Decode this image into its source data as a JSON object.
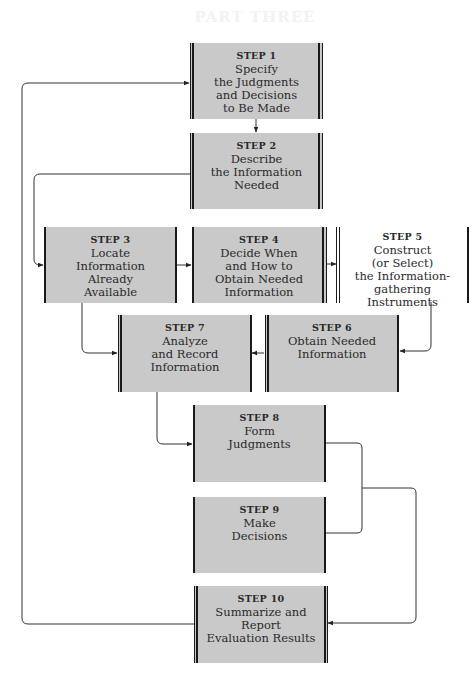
{
  "diagram": {
    "header_bleed": "PART THREE",
    "steps": [
      {
        "id": 1,
        "label": "STEP 1",
        "lines": [
          "Specify",
          "the Judgments",
          "and Decisions",
          "to Be Made"
        ]
      },
      {
        "id": 2,
        "label": "STEP 2",
        "lines": [
          "Describe",
          "the Information",
          "Needed"
        ]
      },
      {
        "id": 3,
        "label": "STEP 3",
        "lines": [
          "Locate",
          "Information",
          "Already",
          "Available"
        ]
      },
      {
        "id": 4,
        "label": "STEP 4",
        "lines": [
          "Decide When",
          "and How to",
          "Obtain Needed",
          "Information"
        ]
      },
      {
        "id": 5,
        "label": "STEP 5",
        "lines": [
          "Construct",
          "(or Select)",
          "the Information-",
          "gathering",
          "Instruments"
        ]
      },
      {
        "id": 6,
        "label": "STEP 6",
        "lines": [
          "Obtain Needed",
          "Information"
        ]
      },
      {
        "id": 7,
        "label": "STEP 7",
        "lines": [
          "Analyze",
          "and Record",
          "Information"
        ]
      },
      {
        "id": 8,
        "label": "STEP 8",
        "lines": [
          "Form",
          "Judgments"
        ]
      },
      {
        "id": 9,
        "label": "STEP 9",
        "lines": [
          "Make",
          "Decisions"
        ]
      },
      {
        "id": 10,
        "label": "STEP 10",
        "lines": [
          "Summarize and",
          "Report",
          "Evaluation Results"
        ]
      }
    ],
    "edges": [
      {
        "from": 1,
        "to": 2
      },
      {
        "from": 2,
        "to": 3
      },
      {
        "from": 3,
        "to": 4
      },
      {
        "from": 4,
        "to": 5
      },
      {
        "from": 5,
        "to": 6
      },
      {
        "from": 6,
        "to": 7
      },
      {
        "from": 3,
        "to": 7
      },
      {
        "from": 7,
        "to": 8
      },
      {
        "from": 8,
        "to": 10
      },
      {
        "from": 9,
        "to": 10
      },
      {
        "from": 10,
        "to": 1
      }
    ],
    "colors": {
      "box_fill": "#c9c9c9",
      "bar": "#1a1a1a",
      "text": "#2a2a2a",
      "line": "#333333"
    }
  }
}
